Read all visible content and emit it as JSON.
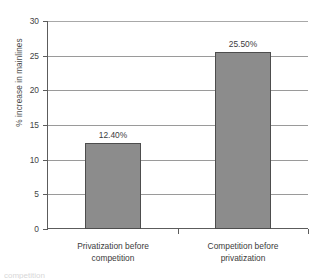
{
  "chart_data": {
    "type": "bar",
    "title": "",
    "xlabel": "",
    "ylabel": "% increase in mainlines",
    "categories": [
      "Privatization before competition",
      "Competition before privatization"
    ],
    "category_lines": [
      [
        "Privatization before",
        "competition"
      ],
      [
        "Competition before",
        "privatization"
      ]
    ],
    "values": [
      12.4,
      25.5
    ],
    "data_labels": [
      "12.40%",
      "25.50%"
    ],
    "ylim": [
      0,
      30
    ],
    "yticks": [
      0,
      5,
      10,
      15,
      20,
      25,
      30
    ],
    "ytick_labels": [
      "0",
      "5",
      "10",
      "15",
      "20",
      "25",
      "30"
    ],
    "grid": true,
    "legend": false,
    "bar_color": "#8c8c8c",
    "bar_border_color": "#4d4d4d",
    "gridline_color": "#9a9a9a",
    "axis_color": "#5c5c5c",
    "background": "#ffffff"
  },
  "footer": {
    "clipped_caption": "competition"
  }
}
